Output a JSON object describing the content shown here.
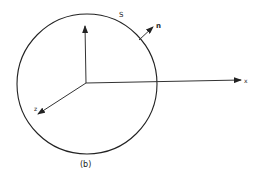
{
  "diagram": {
    "caption": "(b)",
    "surface_label": "S",
    "normal_label": "n",
    "axes": {
      "x_label": "x",
      "z_label": "z",
      "y_label": ""
    },
    "colors": {
      "stroke": "#222222",
      "background": "#ffffff"
    }
  }
}
